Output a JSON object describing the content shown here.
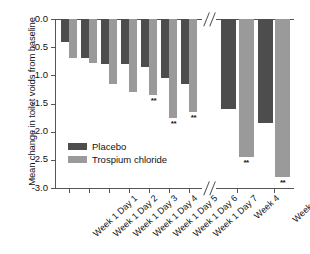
{
  "chart_data": {
    "type": "bar",
    "title": "",
    "xlabel": "",
    "ylabel": "Mean change in toilet voids from baseline",
    "ylim": [
      -3.0,
      0.0
    ],
    "ytick_labels": [
      "0.0",
      "-0.5",
      "-1.0",
      "-1.5",
      "-2.0",
      "-2.5",
      "-3.0"
    ],
    "ytick_values": [
      0.0,
      -0.5,
      -1.0,
      -1.5,
      -2.0,
      -2.5,
      -3.0
    ],
    "grid": false,
    "legend_position": "inside-lower-left",
    "axis_break": true,
    "axis_break_note": "//",
    "categories": [
      "Week 1 Day 1",
      "Week 1 Day 2",
      "Week 1 Day 3",
      "Week 1 Day 4",
      "Week 1 Day 5",
      "Week 1 Day 6",
      "Week 1 Day 7",
      "Week 4",
      "Week 12"
    ],
    "series": [
      {
        "name": "Placebo",
        "color": "#4d4d4d",
        "values": [
          -0.4,
          -0.7,
          -0.8,
          -0.8,
          -0.85,
          -1.05,
          -1.15,
          -1.6,
          -1.85
        ]
      },
      {
        "name": "Trospium chloride",
        "color": "#9a9a9a",
        "values": [
          -0.7,
          -0.78,
          -1.15,
          -1.3,
          -1.35,
          -1.75,
          -1.65,
          -2.45,
          -2.8
        ]
      }
    ],
    "annotations": [
      {
        "category": "Week 1 Day 5",
        "series": "Trospium chloride",
        "text": "**"
      },
      {
        "category": "Week 1 Day 6",
        "series": "Trospium chloride",
        "text": "**"
      },
      {
        "category": "Week 1 Day 7",
        "series": "Trospium chloride",
        "text": "**"
      },
      {
        "category": "Week 4",
        "series": "Trospium chloride",
        "text": "**"
      },
      {
        "category": "Week 12",
        "series": "Trospium chloride",
        "text": "**"
      }
    ]
  },
  "legend": {
    "items": [
      {
        "label": "Placebo",
        "color": "#4d4d4d"
      },
      {
        "label": "Trospium chloride",
        "color": "#9a9a9a"
      }
    ]
  }
}
